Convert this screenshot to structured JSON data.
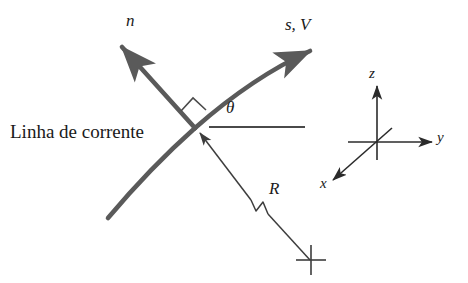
{
  "figure": {
    "background_color": "#ffffff",
    "stream_color": "#5a5a5a",
    "line_color": "#3d3d3d",
    "text_color": "#1a1a1a"
  },
  "labels": {
    "normal_axis": "n",
    "streamwise_axis": "s, V",
    "angle": "θ",
    "radius": "R",
    "streamline": "Linha de corrente",
    "axis_z": "z",
    "axis_y": "y",
    "axis_x": "x"
  },
  "elements": {
    "streamline_curve": "thick curved streamline through intersection point",
    "normal_arrow": "bold arrow pointing up-left, normal direction n",
    "streamwise_arrow": "bold arrow pointing up-right along streamline, s and V",
    "radius_arrow": "thin arrow from center of curvature to streamline point, labeled R",
    "horizontal_reference": "thin horizontal reference line for angle theta",
    "right_angle_marker": "small square marking perpendicularity of n and s",
    "center_marker": "cross marking the center of curvature",
    "coordinate_triad": "x, y, z cartesian axes reference"
  },
  "geometry": {
    "intersection_point": [
      195,
      128
    ],
    "triad_origin": [
      377,
      142
    ],
    "center_of_curvature": [
      310,
      260
    ]
  }
}
